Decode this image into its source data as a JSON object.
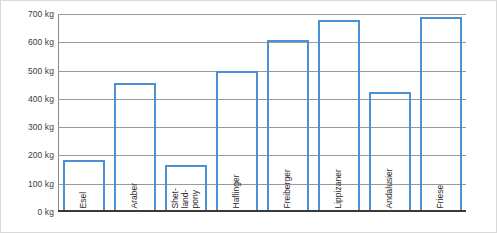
{
  "chart_data": {
    "type": "bar",
    "title": "",
    "subtitle": "",
    "xlabel": "",
    "ylabel": "",
    "unit": "kg",
    "categories": [
      "Esel",
      "Araber",
      "Shet-\nland-\npony",
      "Haflinger",
      "Freiberger",
      "Lippizaner",
      "Andalusier",
      "Friese"
    ],
    "values": [
      185,
      455,
      165,
      500,
      608,
      678,
      425,
      690
    ],
    "ylim": [
      0,
      700
    ],
    "ytick_values": [
      0,
      100,
      200,
      300,
      400,
      500,
      600,
      700
    ],
    "ytick_labels": [
      "0 kg",
      "100 kg",
      "200 kg",
      "300 kg",
      "400 kg",
      "500 kg",
      "600 kg",
      "700 kg"
    ],
    "grid": true,
    "legend": false,
    "legend_position": "none",
    "bar_color": "#4a90d2",
    "bar_fill": "transparent",
    "gridline_color": "#9a9a9a",
    "axis_color": "#3a3a3a",
    "label_color": "#2b2b2b",
    "bars": [
      {
        "category": "Esel",
        "label_lines": [
          "Esel"
        ],
        "value": 185
      },
      {
        "category": "Araber",
        "label_lines": [
          "Araber"
        ],
        "value": 455
      },
      {
        "category": "Shetlandpony",
        "label_lines": [
          "Shet-",
          "land-",
          "pony"
        ],
        "value": 165
      },
      {
        "category": "Haflinger",
        "label_lines": [
          "Haflinger"
        ],
        "value": 500
      },
      {
        "category": "Freiberger",
        "label_lines": [
          "Freiberger"
        ],
        "value": 608
      },
      {
        "category": "Lippizaner",
        "label_lines": [
          "Lippizaner"
        ],
        "value": 678
      },
      {
        "category": "Andalusier",
        "label_lines": [
          "Andalusier"
        ],
        "value": 425
      },
      {
        "category": "Friese",
        "label_lines": [
          "Friese"
        ],
        "value": 690
      }
    ]
  }
}
